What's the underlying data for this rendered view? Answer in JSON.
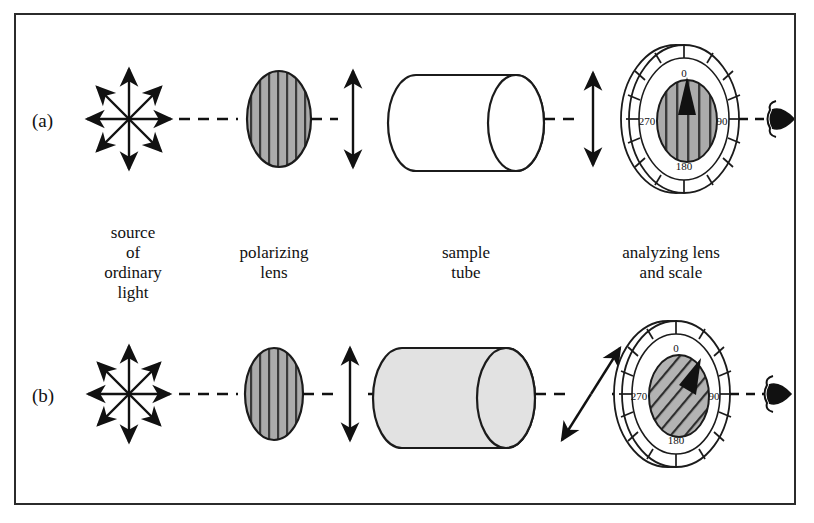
{
  "figure": {
    "kind": "polarimeter-schematic",
    "border_color": "#2b2b2b",
    "background": "#ffffff"
  },
  "panels": [
    {
      "id": "a",
      "label": "(a)",
      "tube_state": "empty",
      "tube_fill": "#ffffff",
      "analyzer_hatch": "vertical",
      "analyzer_pointer_deg": 0,
      "exit_beam": "vertical",
      "exit_beam_deg": 0
    },
    {
      "id": "b",
      "label": "(b)",
      "tube_state": "filled-with-solution",
      "tube_fill": "#e2e2e2",
      "analyzer_hatch": "diagonal",
      "analyzer_pointer_deg": 30,
      "exit_beam": "tilted",
      "exit_beam_deg": 40
    }
  ],
  "captions": {
    "source": "source\nof\nordinary\nlight",
    "source_lines": [
      "source",
      "of",
      "ordinary",
      "light"
    ],
    "polarizer_lines": [
      "polarizing",
      "lens"
    ],
    "tube_lines": [
      "sample",
      "tube"
    ],
    "analyzer_lines": [
      "analyzing lens",
      "and scale"
    ]
  },
  "scale": {
    "labels": [
      "0",
      "90",
      "180",
      "270"
    ],
    "label_0": "0",
    "label_90": "90",
    "label_180": "180",
    "label_270": "270",
    "major_ticks_deg": [
      0,
      90,
      180,
      270
    ],
    "minor_tick_step_deg": 15,
    "total_ticks": 24
  },
  "components": {
    "light_source": "unpolarized-light-starburst",
    "polarizing_lens": "vertically-striped-gray-ellipse",
    "sample_tube": "horizontal-cylinder",
    "analyzer": "rotatable-lens-with-degree-scale",
    "observer": "eye"
  },
  "colors": {
    "ink": "#1b1b1b",
    "lens_gray": "#a9a9a9",
    "solution_gray": "#e2e2e2",
    "dial_face": "#ffffff"
  }
}
